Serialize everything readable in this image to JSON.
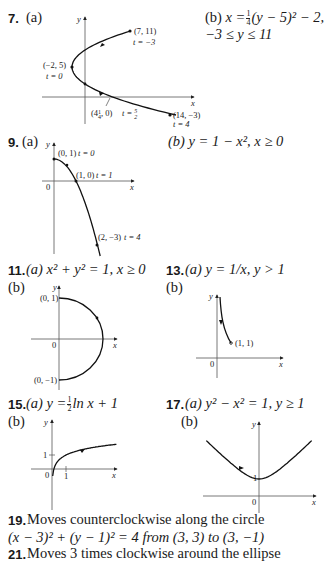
{
  "problems": {
    "p7": {
      "number": "7.",
      "part_a": "(a)",
      "part_b": "(b)",
      "answer_b_line1_pre": "x =",
      "answer_b_frac_num": "1",
      "answer_b_frac_den": "4",
      "answer_b_line1_post": "(y − 5)² − 2,",
      "answer_b_line2": "−3 ≤ y ≤ 11",
      "graph": {
        "axis_x_label": "x",
        "axis_y_label": "y",
        "points": [
          {
            "label": "(7, 11)",
            "t": "t = −3"
          },
          {
            "label": "(−2, 5)",
            "t": "t = 0"
          },
          {
            "label": "(4¼, 0)",
            "t": "t = 5/2"
          },
          {
            "label": "(14, −3)",
            "t": "t = 4"
          }
        ]
      }
    },
    "p9": {
      "number": "9.",
      "part_a": "(a)",
      "answer_b": "(b)  y = 1 − x², x ≥ 0",
      "graph": {
        "axis_x_label": "x",
        "axis_y_label": "y",
        "origin_label": "0",
        "points": [
          {
            "label": "(0, 1)",
            "t": "t = 0"
          },
          {
            "label": "(1, 0)",
            "t": "t = 1"
          },
          {
            "label": "(2, −3)",
            "t": "t = 4"
          }
        ]
      }
    },
    "p11": {
      "number": "11.",
      "answer_a": "(a)  x² + y² = 1, x ≥ 0",
      "part_b": "(b)",
      "graph": {
        "axis_x_label": "x",
        "axis_y_label": "y",
        "origin_label": "0",
        "points": [
          {
            "label": "(0, 1)"
          },
          {
            "label": "(0, −1)"
          }
        ]
      }
    },
    "p13": {
      "number": "13.",
      "answer_a": "(a)  y = 1/x, y > 1",
      "part_b": "(b)",
      "graph": {
        "axis_x_label": "x",
        "axis_y_label": "y",
        "origin_label": "0",
        "points": [
          {
            "label": "(1, 1)"
          }
        ]
      }
    },
    "p15": {
      "number": "15.",
      "answer_a_pre": "(a)  y =",
      "answer_a_frac_num": "1",
      "answer_a_frac_den": "2",
      "answer_a_post": "ln x + 1",
      "part_b": "(b)",
      "graph": {
        "axis_x_label": "x",
        "axis_y_label": "y",
        "origin_label": "0",
        "tick_x": "1",
        "tick_y": "1"
      }
    },
    "p17": {
      "number": "17.",
      "answer_a": "(a)  y² − x² = 1, y ≥ 1",
      "part_b": "(b)",
      "graph": {
        "axis_x_label": "x",
        "axis_y_label": "y",
        "origin_label": "0",
        "tick_y": "1"
      }
    },
    "p19": {
      "number": "19.",
      "line1": "Moves counterclockwise along the circle",
      "line2": "(x − 3)² + (y − 1)² = 4 from (3, 3) to (3, −1)"
    },
    "p21": {
      "number": "21.",
      "line1": "Moves 3 times clockwise around the ellipse"
    }
  }
}
